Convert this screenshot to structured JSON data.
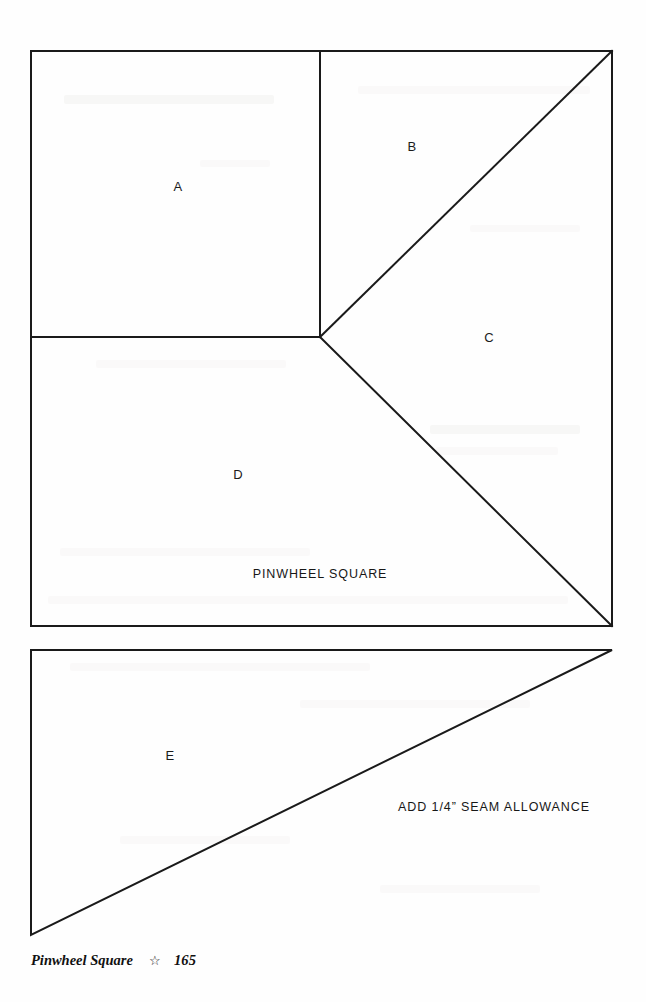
{
  "page": {
    "width": 646,
    "height": 1002,
    "background_color": "#fefefe",
    "ink_color": "#1a1a1a"
  },
  "diagram": {
    "title_caption": "PINWHEEL SQUARE",
    "seam_note": "ADD 1/4” SEAM ALLOWANCE",
    "stroke_color": "#1a1a1a",
    "stroke_width": 2,
    "pieces": [
      {
        "id": "A",
        "label": "A",
        "label_x": 178,
        "label_y": 186,
        "shape": "square"
      },
      {
        "id": "B",
        "label": "B",
        "label_x": 412,
        "label_y": 146,
        "shape": "triangle"
      },
      {
        "id": "C",
        "label": "C",
        "label_x": 489,
        "label_y": 337,
        "shape": "triangle"
      },
      {
        "id": "D",
        "label": "D",
        "label_x": 238,
        "label_y": 474,
        "shape": "triangle"
      },
      {
        "id": "E",
        "label": "E",
        "label_x": 170,
        "label_y": 755,
        "shape": "triangle"
      }
    ],
    "caption_positions": {
      "title_x": 320,
      "title_y": 574,
      "seam_x": 494,
      "seam_y": 807
    },
    "outlines": {
      "main_square": "M 31 51 L 612 51 L 612 626 L 31 626 Z",
      "vertical_divider": "M 320 51 L 320 337",
      "horizontal_divider": "M 31 337 L 320 337",
      "diagonal_upper": "M 320 337 L 612 51",
      "diagonal_lower": "M 320 337 L 612 626",
      "lower_triangle": "M 31 650 L 612 650 L 31 935 Z"
    }
  },
  "footer": {
    "title": "Pinwheel Square",
    "ornament": "☆",
    "ornament_name": "star-outline",
    "page_number": "165"
  }
}
